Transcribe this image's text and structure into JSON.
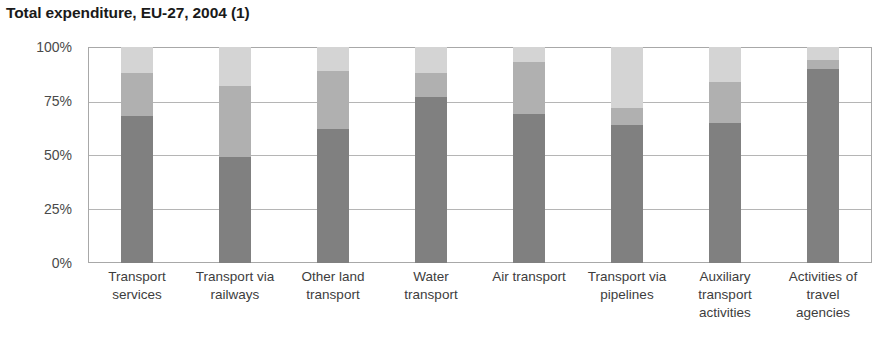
{
  "chart_data": {
    "type": "bar",
    "stacked": true,
    "normalized_percent": true,
    "title": "Total expenditure, EU-27, 2004 (1)",
    "subtitle": "",
    "xlabel": "",
    "ylabel": "",
    "ylim": [
      0,
      100
    ],
    "yticks": [
      0,
      25,
      50,
      75,
      100
    ],
    "ytick_labels": [
      "0%",
      "25%",
      "50%",
      "75%",
      "100%"
    ],
    "grid": true,
    "legend": false,
    "legend_position": "none",
    "annotations": [
      "(1)"
    ],
    "categories": [
      "Transport services",
      "Transport via railways",
      "Other land transport",
      "Water transport",
      "Air transport",
      "Transport via pipelines",
      "Auxiliary transport activities",
      "Activities of travel agencies"
    ],
    "category_lines": [
      [
        "Transport",
        "services"
      ],
      [
        "Transport via",
        "railways"
      ],
      [
        "Other land",
        "transport"
      ],
      [
        "Water",
        "transport"
      ],
      [
        "Air transport"
      ],
      [
        "Transport via",
        "pipelines"
      ],
      [
        "Auxiliary",
        "transport",
        "activities"
      ],
      [
        "Activities of",
        "travel",
        "agencies"
      ]
    ],
    "series": [
      {
        "name": "segment-1-dark",
        "color": "#808080",
        "values": [
          68,
          49,
          62,
          77,
          69,
          64,
          65,
          90
        ]
      },
      {
        "name": "segment-2-medium",
        "color": "#b0b0b0",
        "values": [
          20,
          33,
          27,
          11,
          24,
          8,
          19,
          4
        ]
      },
      {
        "name": "segment-3-light",
        "color": "#d4d4d4",
        "values": [
          12,
          18,
          11,
          12,
          7,
          28,
          16,
          6
        ]
      }
    ],
    "cumulative_tops": [
      [
        68,
        88,
        100
      ],
      [
        49,
        82,
        100
      ],
      [
        62,
        89,
        100
      ],
      [
        77,
        88,
        100
      ],
      [
        69,
        93,
        100
      ],
      [
        64,
        72,
        100
      ],
      [
        65,
        84,
        100
      ],
      [
        90,
        94,
        100
      ]
    ]
  },
  "style": {
    "axis_color": "#a8a8a8",
    "grid_color": "#b5b5b5",
    "tick_label_color": "#4a4a4a",
    "title_color": "#1a1a1a",
    "plot_background": "#ffffff"
  }
}
